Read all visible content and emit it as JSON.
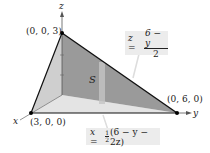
{
  "figure": {
    "axes": {
      "x": "x",
      "y": "y",
      "z": "z"
    },
    "vertices": [
      {
        "label": "(0, 0, 3)"
      },
      {
        "label": "(3, 0, 0)"
      },
      {
        "label": "(0, 6, 0)"
      }
    ],
    "surface_label": "S",
    "equations": {
      "z_eq": {
        "lhs": "z =",
        "num": "6 − y",
        "den": "2"
      },
      "x_eq": {
        "lhs": "x =",
        "frac_num": "1",
        "frac_den": "2",
        "rest": "(6 − y − 2z)"
      }
    },
    "colors": {
      "surface": "#8f8f8f",
      "left_face": "#c8c8c8",
      "floor": "#e2e2e2",
      "edge": "#111111",
      "box": "#ececec"
    }
  }
}
